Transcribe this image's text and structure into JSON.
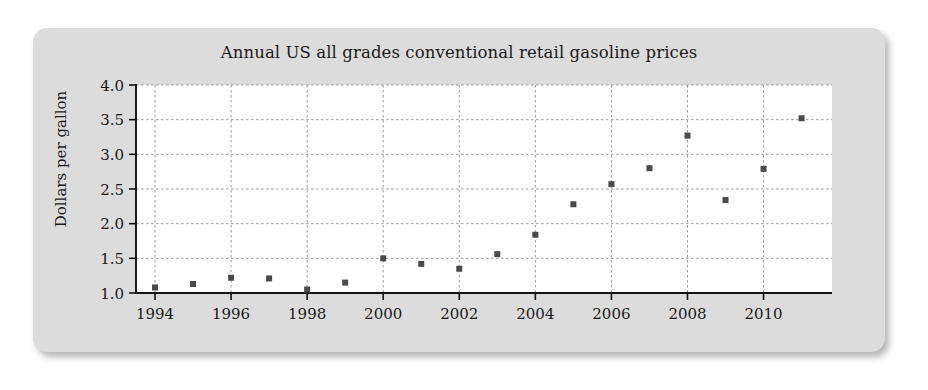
{
  "figure": {
    "title": "Annual US all grades conventional retail gasoline prices",
    "ylabel": "Dollars per gallon",
    "card_color": "#dcdcdc",
    "plot_bg_color": "#ffffff",
    "marker_color": "#4a4a4a",
    "grid_color": "#9a9a9a",
    "axis_color": "#111111"
  },
  "chart_data": {
    "type": "scatter",
    "title": "Annual US all grades conventional retail gasoline prices",
    "xlabel": "",
    "ylabel": "Dollars per gallon",
    "x": [
      1994,
      1995,
      1996,
      1997,
      1998,
      1999,
      2000,
      2001,
      2002,
      2003,
      2004,
      2005,
      2006,
      2007,
      2008,
      2009,
      2010,
      2011
    ],
    "values": [
      1.08,
      1.13,
      1.22,
      1.21,
      1.05,
      1.15,
      1.5,
      1.42,
      1.35,
      1.56,
      1.84,
      2.28,
      2.57,
      2.8,
      3.27,
      2.34,
      2.79,
      3.52
    ],
    "xlim": [
      1993.5,
      2011.8
    ],
    "ylim": [
      1.0,
      4.0
    ],
    "xticks": [
      1994,
      1996,
      1998,
      2000,
      2002,
      2004,
      2006,
      2008,
      2010
    ],
    "xtick_labels": [
      "1994",
      "1996",
      "1998",
      "2000",
      "2002",
      "2004",
      "2006",
      "2008",
      "2010"
    ],
    "yticks": [
      1.0,
      1.5,
      2.0,
      2.5,
      3.0,
      3.5,
      4.0
    ],
    "ytick_labels": [
      "1.0",
      "1.5",
      "2.0",
      "2.5",
      "3.0",
      "3.5",
      "4.0"
    ],
    "grid": true,
    "grid_axis": "both",
    "legend": false,
    "marker": "square",
    "marker_size": 6
  }
}
